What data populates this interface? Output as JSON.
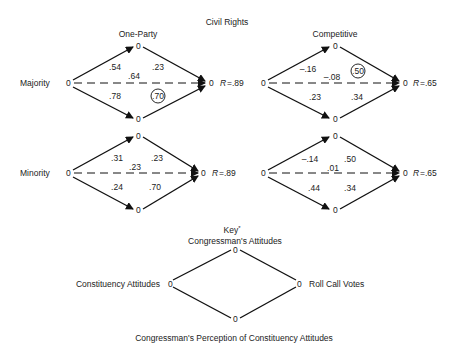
{
  "title": "Civil Rights",
  "node_label": "0",
  "rows": [
    {
      "label": "Majority"
    },
    {
      "label": "Minority"
    }
  ],
  "columns": [
    {
      "label": "One-Party"
    },
    {
      "label": "Competitive"
    }
  ],
  "diagrams": {
    "majority_oneparty": {
      "ca_cp": ".54",
      "cp_rc": ".23",
      "ca_rc": ".64",
      "ca_pp": ".78",
      "pp_rc": ".70",
      "circled": "pp_rc",
      "r_label": "R",
      "r_value": "=.89"
    },
    "majority_competitive": {
      "ca_cp": "–.16",
      "cp_rc": ".50",
      "ca_rc": "–.08",
      "ca_pp": ".23",
      "pp_rc": ".34",
      "circled": "cp_rc",
      "r_label": "R",
      "r_value": "=.65"
    },
    "minority_oneparty": {
      "ca_cp": ".31",
      "cp_rc": ".23",
      "ca_rc": ".23",
      "ca_pp": ".24",
      "pp_rc": ".70",
      "r_label": "R",
      "r_value": "=.89"
    },
    "minority_competitive": {
      "ca_cp": "–.14",
      "cp_rc": ".50",
      "ca_rc": ".01",
      "ca_pp": ".44",
      "pp_rc": ".34",
      "r_label": "R",
      "r_value": "=.65"
    }
  },
  "key": {
    "title": "Key",
    "asterisk": "*",
    "top": "Congressman's Attitudes",
    "left": "Constituency Attitudes",
    "right": "Roll Call Votes",
    "bottom": "Congressman's Perception of Constituency Attitudes"
  }
}
